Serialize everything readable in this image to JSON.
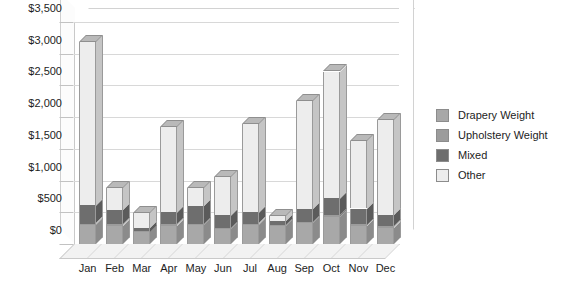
{
  "chart_data": {
    "type": "bar",
    "subtype": "stacked-column-3d",
    "title": "",
    "xlabel": "",
    "ylabel": "",
    "ylim": [
      0,
      3500
    ],
    "ytick_step": 500,
    "ytick_labels": [
      "$0",
      "$500",
      "$1,000",
      "$1,500",
      "$2,000",
      "$2,500",
      "$3,000",
      "$3,500"
    ],
    "ytick_values": [
      0,
      500,
      1000,
      1500,
      2000,
      2500,
      3000,
      3500
    ],
    "grid": true,
    "legend_position": "right",
    "categories": [
      "Jan",
      "Feb",
      "Mar",
      "Apr",
      "May",
      "Jun",
      "Jul",
      "Aug",
      "Sep",
      "Oct",
      "Nov",
      "Dec"
    ],
    "series": [
      {
        "name": "Drapery Weight",
        "color": "#A8A8A8",
        "values": [
          300,
          290,
          190,
          290,
          300,
          230,
          300,
          280,
          330,
          420,
          290,
          260
        ]
      },
      {
        "name": "Upholstery Weight",
        "color": "#9C9C9C",
        "values": [
          20,
          20,
          10,
          20,
          20,
          20,
          20,
          20,
          20,
          30,
          20,
          20
        ]
      },
      {
        "name": "Mixed",
        "color": "#6E6E6E",
        "values": [
          290,
          220,
          60,
          190,
          280,
          200,
          180,
          60,
          200,
          270,
          250,
          180
        ]
      },
      {
        "name": "Other",
        "color": "#EDEDED",
        "values": [
          2580,
          350,
          230,
          1350,
          280,
          610,
          1400,
          80,
          1700,
          2000,
          1070,
          1490
        ]
      }
    ],
    "totals": [
      3190,
      880,
      490,
      1850,
      880,
      1060,
      1900,
      440,
      2250,
      2720,
      1630,
      1950
    ]
  },
  "legend": {
    "items": [
      {
        "label": "Drapery Weight",
        "color": "#A8A8A8"
      },
      {
        "label": "Upholstery Weight",
        "color": "#9C9C9C"
      },
      {
        "label": "Mixed",
        "color": "#6E6E6E"
      },
      {
        "label": "Other",
        "color": "#EDEDED"
      }
    ]
  }
}
